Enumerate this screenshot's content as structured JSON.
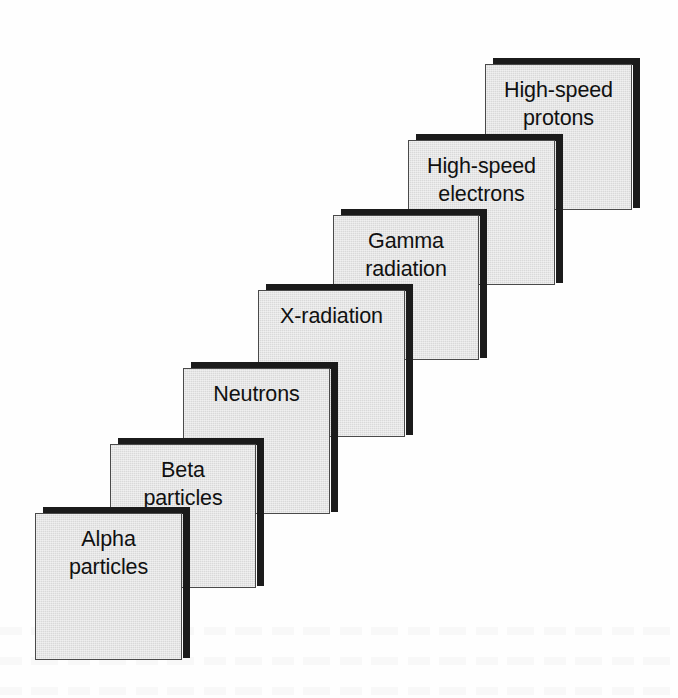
{
  "diagram": {
    "background_color": "#fefefe",
    "card_fill_color": "#d9d9d9",
    "card_border_color": "#4a4a4a",
    "shadow_color": "#1b1b1b",
    "text_color": "#111111",
    "card_width": 147,
    "card_height": 147,
    "shadow_offset_x": 8,
    "shadow_offset_y": -6,
    "shadow_thickness": 7,
    "steps": [
      {
        "id": "alpha-particles",
        "label": "Alpha\nparticles",
        "line1": "Alpha",
        "line2": "particles",
        "order": 1,
        "x": 35,
        "y": 513,
        "width": 147,
        "height": 147
      },
      {
        "id": "beta-particles",
        "label": "Beta\nparticles",
        "line1": "Beta",
        "line2": "particles",
        "order": 2,
        "x": 110,
        "y": 444,
        "width": 146,
        "height": 144
      },
      {
        "id": "neutrons",
        "label": "Neutrons",
        "line1": "Neutrons",
        "line2": "",
        "order": 3,
        "x": 183,
        "y": 368,
        "width": 147,
        "height": 146
      },
      {
        "id": "x-radiation",
        "label": "X-radiation",
        "line1": "X-radiation",
        "line2": "",
        "order": 4,
        "x": 258,
        "y": 290,
        "width": 147,
        "height": 147
      },
      {
        "id": "gamma-radiation",
        "label": "Gamma\nradiation",
        "line1": "Gamma",
        "line2": "radiation",
        "order": 5,
        "x": 333,
        "y": 215,
        "width": 146,
        "height": 145
      },
      {
        "id": "high-speed-electrons",
        "label": "High-speed\nelectrons",
        "line1": "High-speed",
        "line2": "electrons",
        "order": 6,
        "x": 408,
        "y": 140,
        "width": 147,
        "height": 145
      },
      {
        "id": "high-speed-protons",
        "label": "High-speed\nprotons",
        "line1": "High-speed",
        "line2": "protons",
        "order": 7,
        "x": 485,
        "y": 64,
        "width": 147,
        "height": 146
      }
    ]
  }
}
